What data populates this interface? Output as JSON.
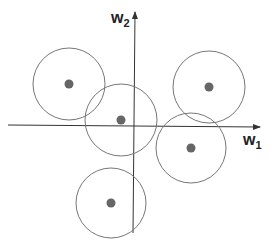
{
  "diagram": {
    "axes": {
      "x_label": "w",
      "x_subscript": "1",
      "y_label": "w",
      "y_subscript": "2",
      "origin": [
        134,
        125
      ]
    },
    "circles": [
      {
        "cx": 69,
        "cy": 84,
        "r": 36
      },
      {
        "cx": 121,
        "cy": 120,
        "r": 36
      },
      {
        "cx": 209,
        "cy": 87,
        "r": 36
      },
      {
        "cx": 191,
        "cy": 148,
        "r": 35
      },
      {
        "cx": 111,
        "cy": 203,
        "r": 35
      }
    ],
    "colors": {
      "axis": "#333333",
      "circle_stroke": "#777777",
      "dot_fill": "#666666"
    }
  }
}
